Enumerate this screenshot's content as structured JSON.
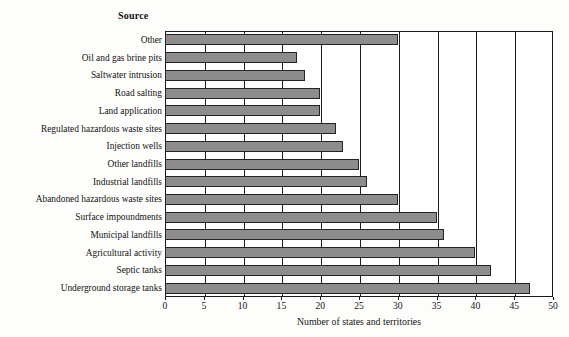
{
  "chart_data": {
    "type": "bar",
    "orientation": "horizontal",
    "title": "",
    "category_axis_title": "Source",
    "xlabel": "Number of states and territories",
    "ylabel": "",
    "xlim": [
      0,
      50
    ],
    "xticks": [
      0,
      5,
      10,
      15,
      20,
      25,
      30,
      35,
      40,
      45,
      50
    ],
    "grid": "vertical gridlines at every x tick",
    "legend": "none",
    "categories": [
      "Other",
      "Oil and gas brine pits",
      "Saltwater intrusion",
      "Road salting",
      "Land application",
      "Regulated hazardous waste sites",
      "Injection wells",
      "Other landfills",
      "Industrial landfills",
      "Abandoned hazardous waste sites",
      "Surface impoundments",
      "Municipal landfills",
      "Agricultural activity",
      "Septic tanks",
      "Underground storage tanks"
    ],
    "values": [
      30,
      17,
      18,
      20,
      20,
      22,
      23,
      25,
      26,
      30,
      35,
      36,
      40,
      42,
      47
    ],
    "colors": {
      "bar_fill": "#8d8d8d",
      "bar_stroke": "#242424",
      "grid": "#1d1d1d",
      "frame": "#1a1a1a",
      "text": "#141414",
      "background": "#fdfdfb"
    }
  },
  "axis": {
    "tick_labels": [
      "0",
      "5",
      "10",
      "15",
      "20",
      "25",
      "30",
      "35",
      "40",
      "45",
      "50"
    ],
    "title": "Number of states and territories"
  },
  "heading": {
    "source_label": "Source"
  }
}
